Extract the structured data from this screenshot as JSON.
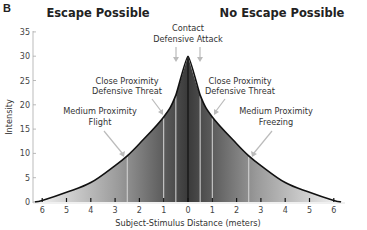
{
  "panel_label": "B",
  "regions": {
    "left_title": "Escape Possible",
    "right_title": "No Escape Possible"
  },
  "annotations": [
    {
      "id": "contact",
      "lines": [
        "Contact",
        "Defensive Attack"
      ],
      "x_m": 0
    },
    {
      "id": "close-left",
      "lines": [
        "Close Proximity",
        "Defensive Threat"
      ],
      "x_m": -1
    },
    {
      "id": "close-right",
      "lines": [
        "Close Proximity",
        "Defensive Threat"
      ],
      "x_m": 1
    },
    {
      "id": "medium-left",
      "lines": [
        "Medium Proximity",
        "Flight"
      ],
      "x_m": -2.5
    },
    {
      "id": "medium-right",
      "lines": [
        "Medium Proximity",
        "Freezing"
      ],
      "x_m": 2.5
    }
  ],
  "colors": {
    "curve": "#111111",
    "fill_dark": "#3a3a3a",
    "fill_light": "#f2f2f2",
    "divider_lines": "#d8d8d8",
    "arrows": "#bbbbbb",
    "axis": "#999999"
  },
  "chart_data": {
    "type": "area",
    "title": "",
    "xlabel": "Subject-Stimulus Distance (meters)",
    "ylabel": "Intensity",
    "x_tick_labels": [
      "6",
      "5",
      "4",
      "3",
      "2",
      "1",
      "0",
      "1",
      "2",
      "3",
      "4",
      "5",
      "6"
    ],
    "y_ticks": [
      0,
      5,
      10,
      15,
      20,
      25,
      30,
      35
    ],
    "ylim": [
      0,
      35
    ],
    "xlim": [
      -6.3,
      6.3
    ],
    "grid": false,
    "legend": "none",
    "x": [
      -6.3,
      -6,
      -5,
      -4,
      -3,
      -2.5,
      -2,
      -1,
      -0.5,
      0,
      0.5,
      1,
      2,
      2.5,
      3,
      4,
      5,
      6,
      6.3
    ],
    "values": [
      0,
      0.3,
      2,
      4,
      7.5,
      9.5,
      12,
      17.5,
      22,
      30,
      22,
      17.5,
      12,
      9.5,
      7.5,
      4,
      2,
      0.3,
      0
    ],
    "boundary_lines_m": [
      -2.5,
      -1,
      -0.5,
      0,
      0.5,
      1,
      2.5
    ],
    "regions": [
      {
        "name": "Escape Possible",
        "side": "left"
      },
      {
        "name": "No Escape Possible",
        "side": "right"
      }
    ]
  }
}
